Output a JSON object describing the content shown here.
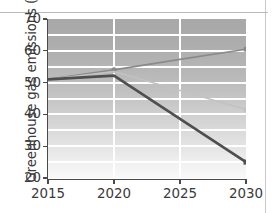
{
  "figure": {
    "ylabel": "Greenhouse gas emissions (Gt)"
  },
  "chart_data": {
    "type": "line",
    "title": "",
    "xlabel": "",
    "ylabel": "Greenhouse gas emissions (Gt)",
    "x": [
      2015,
      2020,
      2025,
      2030
    ],
    "xlim": [
      2015,
      2030
    ],
    "ylim": [
      20,
      70
    ],
    "xticks": [
      2015,
      2020,
      2025,
      2030
    ],
    "xtick_labels": [
      "2015",
      "2020",
      "2025",
      "2030"
    ],
    "yticks": [
      20,
      30,
      40,
      50,
      60,
      70
    ],
    "ytick_labels": [
      "20",
      "30",
      "40",
      "50",
      "60",
      "70"
    ],
    "grid": "horizontal-and-vertical-white-gridlines-every-5-units",
    "legend": "none",
    "series": [
      {
        "name": "rising-series",
        "values": [
          51.0,
          54.0,
          57.3,
          60.5
        ],
        "color": "#8a8a8a",
        "width": 1.6,
        "marker": "circle",
        "marker_at": [
          2020,
          2030
        ]
      },
      {
        "name": "declining-series",
        "values": [
          51.0,
          53.5,
          47.5,
          41.5
        ],
        "color": "#c2c2c2",
        "width": 1.5,
        "marker": "circle",
        "marker_at": [
          2030
        ]
      },
      {
        "name": "steep-decline-series",
        "values": [
          51.0,
          52.2,
          38.6,
          25.0
        ],
        "color": "#4f4f4f",
        "width": 2.6,
        "marker": "square",
        "marker_at": [
          2030
        ]
      }
    ],
    "background": {
      "plot_gradient_top": "#a8a8a8",
      "plot_gradient_bottom": "#f9f9f9",
      "gridline_color": "#ffffff",
      "axis_color": "#4a4a4a",
      "page_color": "#ffffff"
    }
  }
}
